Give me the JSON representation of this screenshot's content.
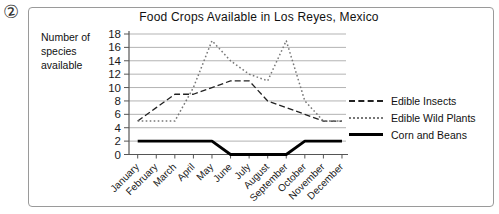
{
  "question_marker": "②",
  "figure": {
    "title": "Food Crops Available in Los Reyes, Mexico",
    "y_axis_label_lines": [
      "Number of",
      "species",
      "available"
    ]
  },
  "chart_data": {
    "type": "line",
    "title": "Food Crops Available in Los Reyes, Mexico",
    "xlabel": "",
    "ylabel": "Number of species available",
    "ylim": [
      0,
      18
    ],
    "ytick_step": 2,
    "grid": true,
    "legend_position": "right",
    "categories": [
      "January",
      "February",
      "March",
      "April",
      "May",
      "June",
      "July",
      "August",
      "September",
      "October",
      "November",
      "December"
    ],
    "series": [
      {
        "name": "Edible Insects",
        "line_style": "dashed",
        "color": "#222222",
        "values": [
          5,
          7,
          9,
          9,
          10,
          11,
          11,
          8,
          7,
          6,
          5,
          5
        ]
      },
      {
        "name": "Edible Wild Plants",
        "line_style": "dotted",
        "color": "#777777",
        "values": [
          5,
          5,
          5,
          10,
          17,
          14,
          12,
          11,
          17,
          8,
          5,
          5
        ]
      },
      {
        "name": "Corn and Beans",
        "line_style": "solid-thick",
        "color": "#000000",
        "values": [
          2,
          2,
          2,
          2,
          2,
          0,
          0,
          0,
          0,
          2,
          2,
          2
        ]
      }
    ]
  },
  "colors": {
    "grid": "#b3b3b3",
    "axis": "#555555",
    "tick_text": "#1a1a1a",
    "border": "#9a9a9a"
  }
}
